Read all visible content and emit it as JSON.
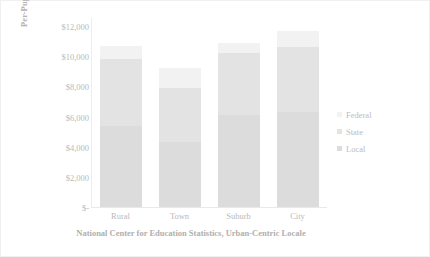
{
  "chart_data": {
    "type": "bar",
    "stacked": true,
    "title": "",
    "xlabel": "National Center for Education Statistics, Urban-Centric Locale",
    "ylabel": "Per-Pupil Expenditure",
    "categories": [
      "Rural",
      "Town",
      "Suburb",
      "City"
    ],
    "series": [
      {
        "name": "Local",
        "values": [
          5400,
          4300,
          6100,
          6300
        ],
        "color": "#dcdcdc"
      },
      {
        "name": "State",
        "values": [
          4400,
          3600,
          4100,
          4300
        ],
        "color": "#e3e3e3"
      },
      {
        "name": "Federal",
        "values": [
          900,
          1300,
          700,
          1100
        ],
        "color": "#f2f2f2"
      }
    ],
    "totals": [
      10700,
      9200,
      10900,
      11700
    ],
    "ylim": [
      0,
      12000
    ],
    "ytick_values": [
      0,
      2000,
      4000,
      6000,
      8000,
      10000,
      12000
    ],
    "ytick_labels": [
      "$-",
      "$2,000",
      "$4,000",
      "$6,000",
      "$8,000",
      "$10,000",
      "$12,000"
    ],
    "legend_position": "right",
    "legend_entries": [
      "Federal",
      "State",
      "Local"
    ],
    "grid": false
  }
}
